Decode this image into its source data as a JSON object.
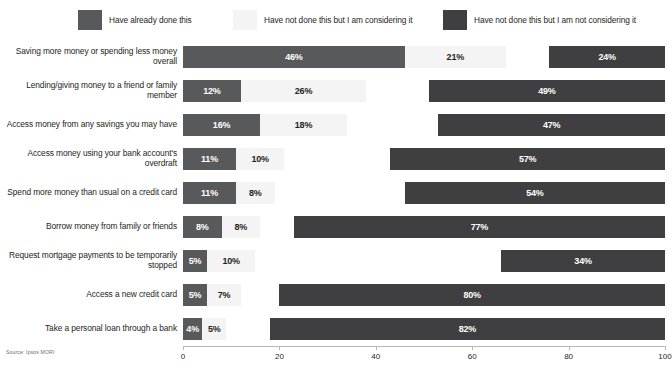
{
  "legend": {
    "items": [
      {
        "label": "Have already done this",
        "color": "#58595b",
        "key": "done"
      },
      {
        "label": "Have not done this but I am considering it",
        "color": "#f4f4f4",
        "key": "consider"
      },
      {
        "label": "Have not done this but I am not considering it",
        "color": "#3f3f41",
        "key": "not"
      }
    ]
  },
  "source": "Source: Ipsos MORI",
  "chart_data": {
    "type": "bar",
    "title": "",
    "subtitle": "",
    "xlabel": "",
    "ylabel": "",
    "orientation": "horizontal",
    "grid": false,
    "legend_position": "top",
    "xlim": [
      0,
      100
    ],
    "xticks": [
      0,
      20,
      40,
      60,
      80,
      100
    ],
    "xtick_labels": [
      "0",
      "20",
      "40",
      "60",
      "80",
      "100"
    ],
    "value_suffix": "%",
    "categories": [
      "Saving more money or spending less money overall",
      "Lending/giving money to a friend or family member",
      "Access money from any savings you may have",
      "Access money using your bank account's overdraft",
      "Spend more money than usual on a credit card",
      "Borrow money from family or friends",
      "Request mortgage payments to be temporarily stopped",
      "Access a new credit card",
      "Take a personal loan through a bank"
    ],
    "series": [
      {
        "name": "Have already done this",
        "color": "#58595b",
        "values": [
          46,
          12,
          16,
          11,
          11,
          8,
          5,
          5,
          4
        ],
        "labels": [
          "46%",
          "12%",
          "16%",
          "11%",
          "11%",
          "8%",
          "5%",
          "5%",
          "4%"
        ]
      },
      {
        "name": "Have not done this but I am considering it",
        "color": "#f4f4f4",
        "values": [
          21,
          26,
          18,
          10,
          8,
          8,
          10,
          7,
          5
        ],
        "labels": [
          "21%",
          "26%",
          "18%",
          "10%",
          "8%",
          "8%",
          "10%",
          "7%",
          "5%"
        ]
      },
      {
        "name": "Have not done this but I am not considering it",
        "color": "#3f3f41",
        "values": [
          24,
          49,
          47,
          57,
          54,
          77,
          34,
          80,
          82
        ],
        "labels": [
          "24%",
          "49%",
          "47%",
          "57%",
          "54%",
          "77%",
          "34%",
          "80%",
          "82%"
        ]
      }
    ]
  }
}
